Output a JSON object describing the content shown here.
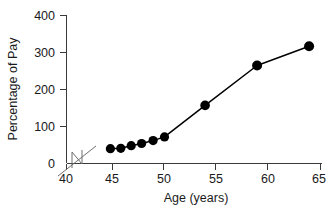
{
  "chart_data": {
    "type": "line",
    "title": "",
    "xlabel": "Age (years)",
    "ylabel": "Percentage of Pay",
    "xlim": [
      43.0,
      65.0
    ],
    "ylim": [
      0,
      400
    ],
    "xticks": [
      40,
      45,
      50,
      55,
      60,
      65
    ],
    "yticks": [
      0,
      100,
      200,
      300,
      400
    ],
    "xtick_labels": [
      "40",
      "45",
      "50",
      "55",
      "60",
      "65"
    ],
    "ytick_labels": [
      "0",
      "100",
      "200",
      "300",
      "400"
    ],
    "grid": false,
    "legend": false,
    "axis_break": {
      "axis": "x",
      "label": "x-axis-break",
      "between": [
        40,
        43
      ]
    },
    "series": [
      {
        "name": "Percentage of Pay",
        "marker": "filled-circle",
        "color": "#000000",
        "x": [
          44.8,
          45.8,
          46.8,
          47.8,
          48.9,
          50.0,
          53.9,
          58.9,
          63.9
        ],
        "y": [
          40,
          41,
          48,
          54,
          62,
          72,
          157,
          265,
          317
        ],
        "points": [
          {
            "age": 44.8,
            "percentage_of_pay": 40
          },
          {
            "age": 45.8,
            "percentage_of_pay": 41
          },
          {
            "age": 46.8,
            "percentage_of_pay": 48
          },
          {
            "age": 47.8,
            "percentage_of_pay": 54
          },
          {
            "age": 48.9,
            "percentage_of_pay": 62
          },
          {
            "age": 50.0,
            "percentage_of_pay": 72
          },
          {
            "age": 53.9,
            "percentage_of_pay": 157
          },
          {
            "age": 58.9,
            "percentage_of_pay": 265
          },
          {
            "age": 63.9,
            "percentage_of_pay": 317
          }
        ]
      }
    ],
    "colors": {
      "line": "#000000",
      "marker": "#000000",
      "axis": "#3a3a3a",
      "break": "#6e6e6e",
      "text": "#1a1a1a",
      "background": "#ffffff"
    }
  }
}
